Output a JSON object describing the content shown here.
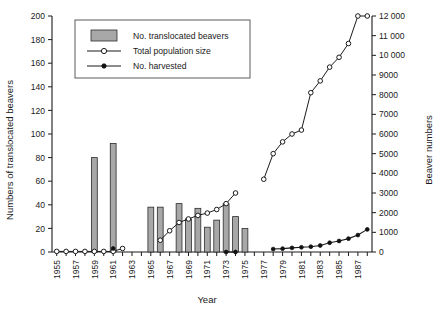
{
  "chart_data": {
    "type": "bar",
    "title": "",
    "xlabel": "Year",
    "ylabel": "Numbers of translocated beavers",
    "y2label": "Beaver numbers",
    "grid": false,
    "legend_position": "top-left-inside",
    "xlim": [
      1954.5,
      1988.5
    ],
    "ylim": [
      0,
      200
    ],
    "y2lim": [
      0,
      12000
    ],
    "y_ticks": [
      0,
      20,
      40,
      60,
      80,
      100,
      120,
      140,
      160,
      180,
      200
    ],
    "y_ticklabels": [
      "0",
      "20",
      "40",
      "60",
      "80",
      "100",
      "120",
      "140",
      "160",
      "180",
      "200"
    ],
    "y2_ticks": [
      0,
      1000,
      2000,
      3000,
      4000,
      5000,
      6000,
      7000,
      8000,
      9000,
      10000,
      11000,
      12000
    ],
    "y2_ticklabels": [
      "0",
      "1000",
      "2000",
      "3000",
      "4000",
      "5000",
      "6000",
      "7000",
      "8000",
      "9000",
      "10 000",
      "11 000",
      "12 000"
    ],
    "x_ticks": [
      1955,
      1956,
      1957,
      1958,
      1959,
      1960,
      1961,
      1962,
      1963,
      1964,
      1965,
      1966,
      1967,
      1968,
      1969,
      1970,
      1971,
      1972,
      1973,
      1974,
      1975,
      1976,
      1977,
      1978,
      1979,
      1980,
      1981,
      1982,
      1983,
      1984,
      1985,
      1986,
      1987,
      1988
    ],
    "x_ticklabels": [
      "1955",
      "1957",
      "1959",
      "1961",
      "1963",
      "1965",
      "1967",
      "1969",
      "1971",
      "1973",
      "1975",
      "1977",
      "1979",
      "1981",
      "1983",
      "1985",
      "1987"
    ],
    "x_labelled_years": [
      1955,
      1957,
      1959,
      1961,
      1963,
      1965,
      1967,
      1969,
      1971,
      1973,
      1975,
      1977,
      1979,
      1981,
      1983,
      1985,
      1987
    ],
    "series": [
      {
        "name": "No. translocated beavers",
        "type": "bar",
        "axis": "left",
        "color": "#a8a8a8",
        "x": [
          1959,
          1961,
          1965,
          1966,
          1968,
          1969,
          1970,
          1971,
          1972,
          1973,
          1974,
          1975
        ],
        "values": [
          80,
          92,
          38,
          38,
          41,
          28,
          37,
          21,
          27,
          41,
          30,
          20
        ]
      },
      {
        "name": "Total population size",
        "type": "line",
        "marker": "open-circle",
        "axis": "left-early-right-late",
        "color": "#1a1a1a",
        "early_axis": "left",
        "early_x": [
          1955,
          1956,
          1957,
          1958,
          1959,
          1960,
          1961,
          1962
        ],
        "early_values": [
          0.5,
          0.5,
          0.5,
          0.5,
          0.5,
          0.5,
          0.5,
          3
        ],
        "mid_axis": "left",
        "mid_x": [
          1966,
          1967,
          1968,
          1969,
          1970,
          1971,
          1972,
          1973,
          1974
        ],
        "mid_values": [
          10,
          18,
          25,
          28,
          31,
          33,
          36,
          41,
          50
        ],
        "late_axis": "right",
        "late_x": [
          1977,
          1978,
          1979,
          1980,
          1981,
          1982,
          1983,
          1984,
          1985,
          1986,
          1987,
          1988
        ],
        "late_values": [
          3700,
          5000,
          5600,
          6000,
          6200,
          8100,
          8700,
          9400,
          9900,
          10600,
          12000,
          12000
        ]
      },
      {
        "name": "No. harvested",
        "type": "line",
        "marker": "filled-circle",
        "axis": "left-early-right-late",
        "color": "#111111",
        "early_axis": "left",
        "early_x": [
          1961
        ],
        "early_values": [
          3
        ],
        "mid_axis": "left",
        "mid_x": [
          1973,
          1974
        ],
        "mid_values": [
          0,
          0
        ],
        "late_axis": "right",
        "late_x": [
          1978,
          1979,
          1980,
          1981,
          1982,
          1983,
          1984,
          1985,
          1986,
          1987,
          1988
        ],
        "late_values": [
          150,
          170,
          210,
          240,
          270,
          330,
          470,
          560,
          680,
          860,
          1150
        ]
      }
    ]
  },
  "legend": {
    "items": [
      {
        "label": "No. translocated beavers",
        "marker": "bar-swatch"
      },
      {
        "label": "Total population size",
        "marker": "open-circle-line"
      },
      {
        "label": "No. harvested",
        "marker": "filled-circle-line"
      }
    ]
  },
  "axes": {
    "left_title": "Numbers of translocated beavers",
    "right_title": "Beaver numbers",
    "x_title": "Year"
  }
}
